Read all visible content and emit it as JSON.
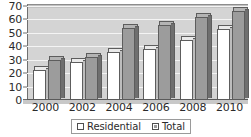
{
  "chart_data": {
    "type": "bar",
    "title": "",
    "xlabel": "",
    "ylabel": "",
    "categories": [
      "2000",
      "2002",
      "2004",
      "2006",
      "2008",
      "2010"
    ],
    "series": [
      {
        "name": "Residential",
        "values": [
          22,
          28,
          36,
          38,
          45,
          53
        ],
        "color": "#ffffff"
      },
      {
        "name": "Total",
        "values": [
          30,
          32,
          54,
          56,
          62,
          66
        ],
        "color": "#9c9c9c"
      }
    ],
    "ylim": [
      0,
      70
    ],
    "ytick_labels": [
      "0",
      "10",
      "20",
      "30",
      "40",
      "50",
      "60",
      "70"
    ],
    "ytick_values": [
      0,
      10,
      20,
      30,
      40,
      50,
      60,
      70
    ],
    "grid": true,
    "legend_position": "bottom",
    "legend": [
      "Residential",
      "Total"
    ]
  }
}
